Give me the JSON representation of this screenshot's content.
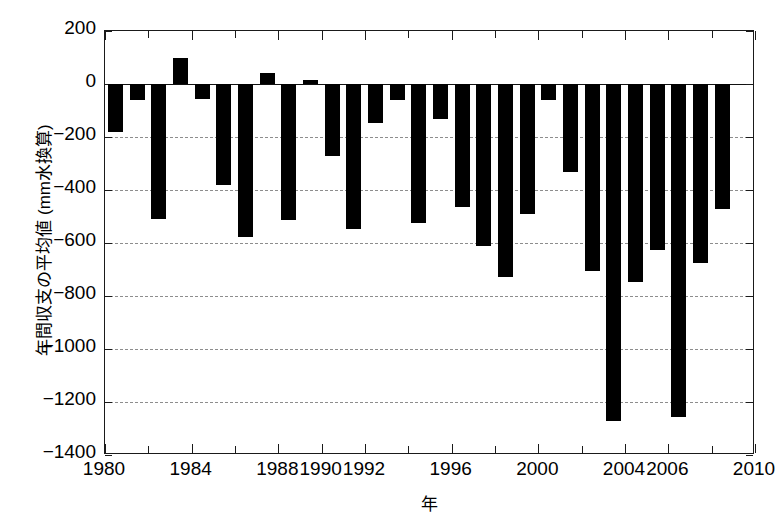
{
  "chart_data": {
    "type": "bar",
    "title": "",
    "xlabel": "年",
    "ylabel": "年間収支の平均値 (mm水換算)",
    "xlim": [
      1980,
      2010
    ],
    "ylim": [
      -1400,
      200
    ],
    "ytick_labels": [
      "200",
      "0",
      "−200",
      "−400",
      "−600",
      "−800",
      "−1000",
      "−1200",
      "−1400"
    ],
    "ytick_values": [
      200,
      0,
      -200,
      -400,
      -600,
      -800,
      -1000,
      -1200,
      -1400
    ],
    "xtick_labels": [
      "1980",
      "1984",
      "1988",
      "1990",
      "1992",
      "1996",
      "2000",
      "2004",
      "2006",
      "2010"
    ],
    "xtick_values": [
      1980,
      1984,
      1988,
      1990,
      1992,
      1996,
      2000,
      2004,
      2006,
      2010
    ],
    "grid": "horizontal dashed at each y tick",
    "legend": "none",
    "bar_color": "#000000",
    "categories": [
      1980,
      1981,
      1982,
      1983,
      1984,
      1985,
      1986,
      1987,
      1988,
      1989,
      1990,
      1991,
      1992,
      1993,
      1994,
      1995,
      1996,
      1997,
      1998,
      1999,
      2000,
      2001,
      2002,
      2003,
      2004,
      2005,
      2006,
      2007,
      2008
    ],
    "values": [
      -181,
      -60,
      -508,
      100,
      -55,
      -380,
      -578,
      43,
      -515,
      16,
      -271,
      -547,
      -148,
      -60,
      -523,
      -131,
      -463,
      -612,
      -728,
      -492,
      -59,
      -331,
      -707,
      -1272,
      -747,
      -625,
      -1255,
      -675,
      -470
    ]
  },
  "axis": {
    "y_title": "年間収支の平均値 (mm水換算)",
    "x_title": "年"
  }
}
